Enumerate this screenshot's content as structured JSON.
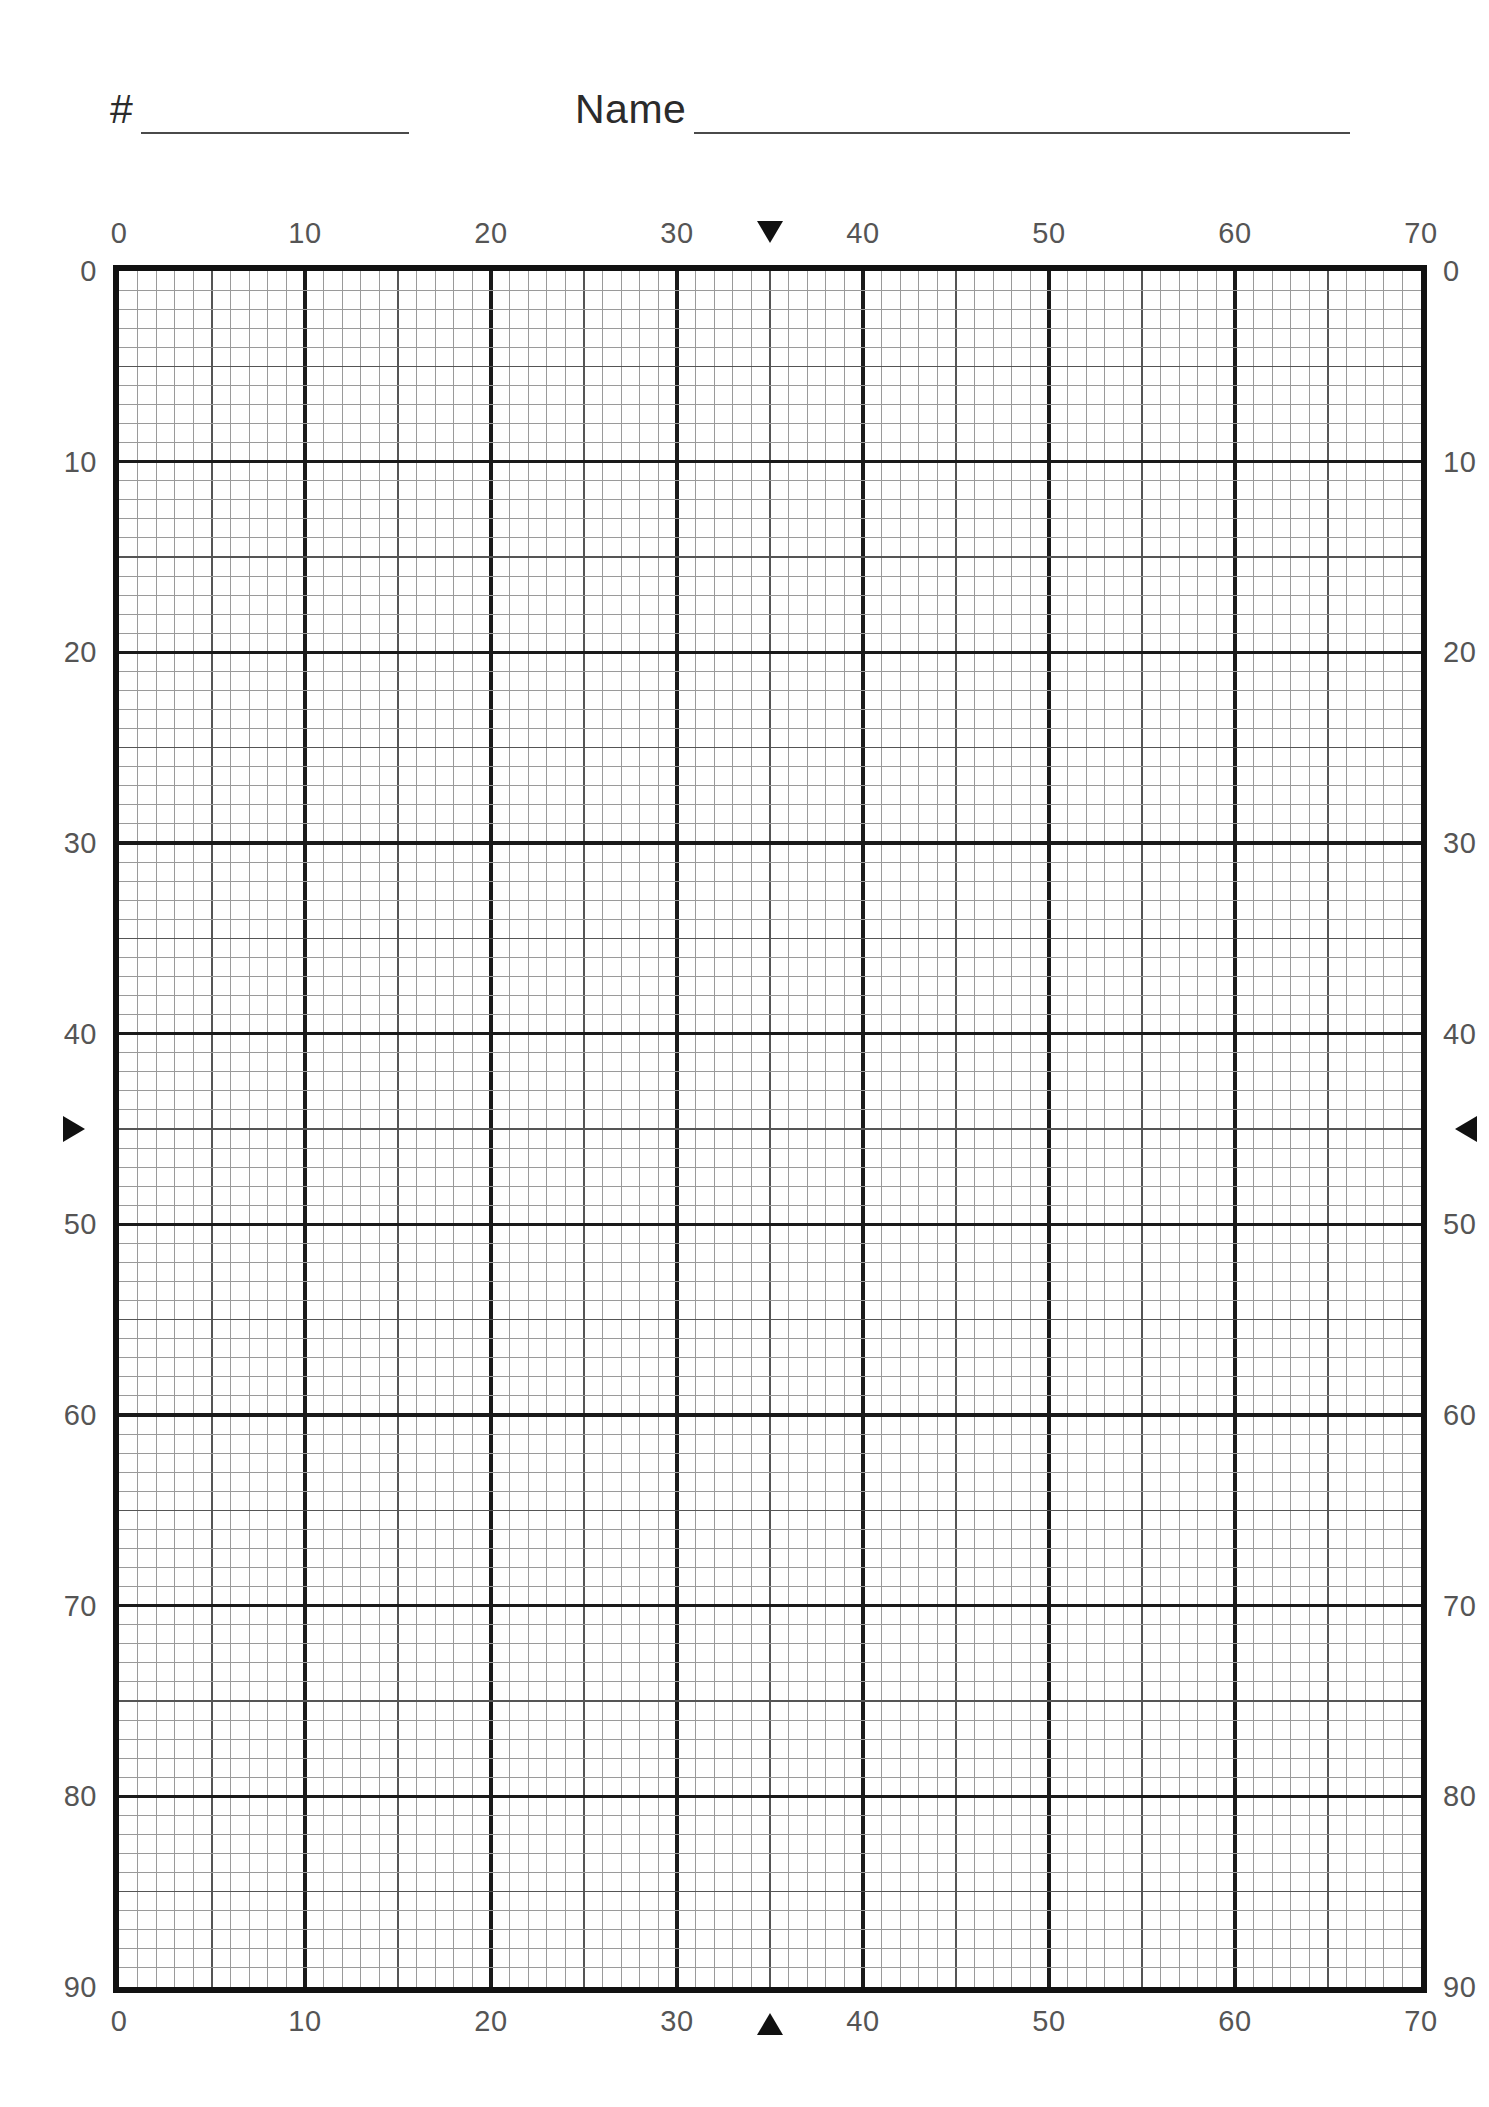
{
  "header": {
    "number_label": "#",
    "number_value": "",
    "name_label": "Name",
    "name_value": ""
  },
  "chart_data": {
    "type": "grid",
    "title": "",
    "xlabel": "",
    "ylabel": "",
    "grid": true,
    "xlim": [
      0,
      70
    ],
    "ylim": [
      0,
      90
    ],
    "y_axis_inverted": true,
    "minor_step": 1,
    "medium_step": 5,
    "major_step": 10,
    "x_tick_labels": [
      "0",
      "10",
      "20",
      "30",
      "40",
      "50",
      "60",
      "70"
    ],
    "x_tick_values": [
      0,
      10,
      20,
      30,
      40,
      50,
      60,
      70
    ],
    "y_tick_labels": [
      "0",
      "10",
      "20",
      "30",
      "40",
      "50",
      "60",
      "70",
      "80",
      "90"
    ],
    "y_tick_values": [
      0,
      10,
      20,
      30,
      40,
      50,
      60,
      70,
      80,
      90
    ],
    "axes_shown": [
      "top",
      "bottom",
      "left",
      "right"
    ],
    "series": [],
    "annotations": [
      {
        "name": "top-marker",
        "glyph": "▼",
        "axis": "top",
        "value": 35
      },
      {
        "name": "bottom-marker",
        "glyph": "▲",
        "axis": "bottom",
        "value": 35
      },
      {
        "name": "left-marker",
        "glyph": "▶",
        "axis": "left",
        "value": 45
      },
      {
        "name": "right-marker",
        "glyph": "◀",
        "axis": "right",
        "value": 45
      }
    ],
    "colors": {
      "frame": "#111111",
      "major_line": "#1a1a1a",
      "medium_line": "#555555",
      "minor_line": "#9a9a9a",
      "label": "#555555",
      "background": "#ffffff"
    }
  }
}
